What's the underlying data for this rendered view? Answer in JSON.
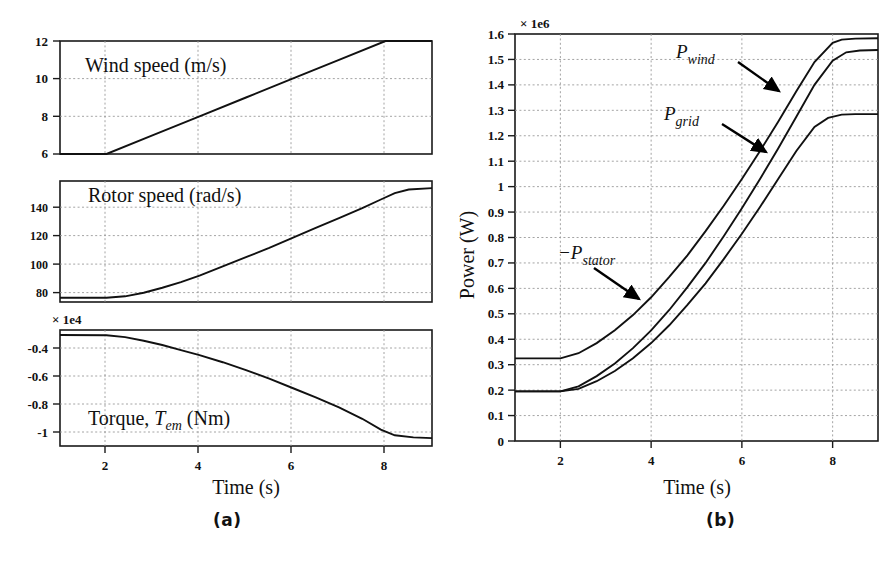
{
  "figure": {
    "captions": {
      "left": "(a)",
      "right": "(b)"
    }
  },
  "panel_a": {
    "xaxis_title": "Time (s)",
    "subplots": [
      {
        "name": "wind-speed",
        "inplot_label": "Wind speed (m/s)",
        "yticks": [
          "6",
          "8",
          "10",
          "12"
        ],
        "exponent": ""
      },
      {
        "name": "rotor-speed",
        "inplot_label": "Rotor speed (rad/s)",
        "yticks": [
          "80",
          "100",
          "120",
          "140"
        ],
        "exponent": ""
      },
      {
        "name": "torque",
        "inplot_label_parts": {
          "pre": "Torque, ",
          "sym": "T",
          "sub": "em",
          "post": " (Nm)"
        },
        "yticks": [
          "-1",
          "-0.8",
          "-0.6",
          "-0.4"
        ],
        "exponent": "× 1e4"
      }
    ],
    "xticks": [
      "2",
      "4",
      "6",
      "8"
    ]
  },
  "panel_b": {
    "yaxis_title": "Power (W)",
    "xaxis_title": "Time (s)",
    "exponent": "× 1e6",
    "annotations": [
      {
        "name": "p-wind",
        "sign": "",
        "sym": "P",
        "sub": "wind"
      },
      {
        "name": "p-grid",
        "sign": "",
        "sym": "P",
        "sub": "grid"
      },
      {
        "name": "p-stator",
        "sign": "−",
        "sym": "P",
        "sub": "stator"
      }
    ]
  },
  "chart_data": [
    {
      "type": "line",
      "name": "wind-speed",
      "title": "Wind speed (m/s)",
      "xlabel": "Time (s)",
      "ylabel": "Wind speed (m/s)",
      "xlim": [
        1,
        9
      ],
      "ylim": [
        6,
        12
      ],
      "xticks": [
        2,
        4,
        6,
        8
      ],
      "yticks": [
        6,
        8,
        10,
        12
      ],
      "grid": true,
      "series": [
        {
          "name": "wind speed",
          "x": [
            1,
            2,
            3,
            4,
            5,
            6,
            7,
            8,
            9
          ],
          "y": [
            6,
            6,
            7,
            8,
            9,
            10,
            11,
            12,
            12
          ]
        }
      ]
    },
    {
      "type": "line",
      "name": "rotor-speed",
      "title": "Rotor speed (rad/s)",
      "xlabel": "Time (s)",
      "ylabel": "Rotor speed (rad/s)",
      "xlim": [
        1,
        9
      ],
      "ylim": [
        72,
        157
      ],
      "xticks": [
        2,
        4,
        6,
        8
      ],
      "yticks": [
        80,
        100,
        120,
        140
      ],
      "grid": true,
      "series": [
        {
          "name": "rotor speed",
          "x": [
            1,
            2,
            2.4,
            2.8,
            3.2,
            3.6,
            4,
            4.5,
            5,
            5.5,
            6,
            6.5,
            7,
            7.5,
            7.9,
            8.2,
            8.5,
            9
          ],
          "y": [
            75,
            75,
            76,
            78.5,
            82,
            86,
            90.5,
            97,
            103.5,
            110,
            117,
            124,
            131,
            138,
            144,
            148.5,
            151,
            152
          ]
        }
      ]
    },
    {
      "type": "line",
      "name": "torque",
      "title": "Torque, T_em (Nm)",
      "xlabel": "Time (s)",
      "ylabel": "Torque (Nm)",
      "scale": "1e4",
      "xlim": [
        1,
        9
      ],
      "ylim": [
        -1.06,
        -0.25
      ],
      "xticks": [
        2,
        4,
        6,
        8
      ],
      "yticks": [
        -1,
        -0.8,
        -0.6,
        -0.4
      ],
      "grid": true,
      "series": [
        {
          "name": "electromagnetic torque",
          "x": [
            1,
            2,
            2.4,
            2.8,
            3.2,
            3.6,
            4,
            4.5,
            5,
            5.5,
            6,
            6.5,
            7,
            7.5,
            7.9,
            8.2,
            8.6,
            9
          ],
          "y": [
            -0.285,
            -0.287,
            -0.3,
            -0.325,
            -0.355,
            -0.39,
            -0.425,
            -0.475,
            -0.53,
            -0.59,
            -0.655,
            -0.72,
            -0.79,
            -0.87,
            -0.945,
            -0.985,
            -1.0,
            -1.005
          ]
        }
      ]
    },
    {
      "type": "line",
      "name": "power",
      "title": "Power (W)",
      "xlabel": "Time (s)",
      "ylabel": "Power (W)",
      "scale": "1e6",
      "xlim": [
        1,
        9
      ],
      "ylim": [
        0,
        1.6
      ],
      "xticks": [
        2,
        4,
        6,
        8
      ],
      "yticks": [
        0,
        0.1,
        0.2,
        0.3,
        0.4,
        0.5,
        0.6,
        0.7,
        0.8,
        0.9,
        1,
        1.1,
        1.2,
        1.3,
        1.4,
        1.5,
        1.6
      ],
      "grid": true,
      "series": [
        {
          "name": "P_wind",
          "x": [
            1,
            2,
            2.4,
            2.8,
            3.2,
            3.6,
            4,
            4.4,
            4.8,
            5.2,
            5.6,
            6,
            6.4,
            6.8,
            7.2,
            7.6,
            8,
            8.2,
            8.5,
            9
          ],
          "y": [
            0.325,
            0.325,
            0.345,
            0.385,
            0.435,
            0.495,
            0.565,
            0.645,
            0.73,
            0.825,
            0.925,
            1.03,
            1.14,
            1.255,
            1.375,
            1.49,
            1.565,
            1.578,
            1.582,
            1.583
          ]
        },
        {
          "name": "P_grid",
          "x": [
            1,
            2,
            2.4,
            2.8,
            3.2,
            3.6,
            4,
            4.4,
            4.8,
            5.2,
            5.6,
            6,
            6.4,
            6.8,
            7.2,
            7.6,
            8,
            8.3,
            8.6,
            9
          ],
          "y": [
            0.195,
            0.195,
            0.215,
            0.255,
            0.305,
            0.365,
            0.435,
            0.515,
            0.605,
            0.7,
            0.805,
            0.915,
            1.03,
            1.15,
            1.275,
            1.4,
            1.495,
            1.528,
            1.535,
            1.537
          ]
        },
        {
          "name": "-P_stator",
          "x": [
            1,
            2,
            2.4,
            2.8,
            3.2,
            3.6,
            4,
            4.4,
            4.8,
            5.2,
            5.6,
            6,
            6.4,
            6.8,
            7.2,
            7.6,
            7.9,
            8.2,
            8.5,
            9
          ],
          "y": [
            0.195,
            0.195,
            0.205,
            0.235,
            0.275,
            0.325,
            0.385,
            0.455,
            0.535,
            0.62,
            0.715,
            0.815,
            0.92,
            1.03,
            1.14,
            1.235,
            1.27,
            1.283,
            1.285,
            1.285
          ]
        }
      ]
    }
  ]
}
